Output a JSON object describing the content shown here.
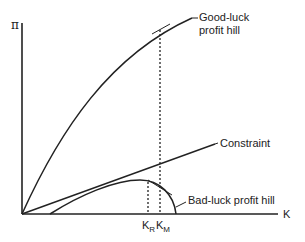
{
  "diagram": {
    "axes": {
      "y_label": "π",
      "x_label": "K"
    },
    "curves": {
      "good_luck": {
        "label_line1": "Good-luck",
        "label_line2": "profit hill"
      },
      "constraint": {
        "label": "Constraint"
      },
      "bad_luck": {
        "label": "Bad-luck profit hill"
      }
    },
    "ticks": {
      "k_r": {
        "main": "K",
        "sub": "R"
      },
      "k_m": {
        "main": "K",
        "sub": "M"
      }
    }
  }
}
